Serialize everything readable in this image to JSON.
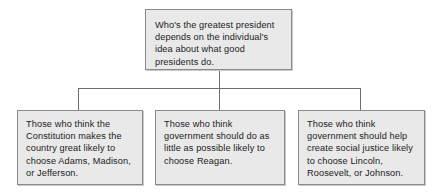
{
  "diagram": {
    "type": "hierarchy-tree",
    "colors": {
      "box_fill": "#e9e9e9",
      "box_border": "#8a8a8a",
      "connector": "#6e6e6e",
      "text": "#1b1b1b",
      "background": "#ffffff"
    },
    "root": {
      "text": "Who's the greatest president depends on the individual's idea about what good presidents do."
    },
    "branches": [
      {
        "id": "constitution",
        "text": "Those who think the Constitution makes the country great likely to choose Adams, Madison, or Jefferson."
      },
      {
        "id": "limited-government",
        "text": "Those who think government should do as little as possible likely to choose Reagan."
      },
      {
        "id": "social-justice",
        "text": "Those who think government should help create social justice likely to choose Lincoln, Roosevelt, or Johnson."
      }
    ]
  }
}
